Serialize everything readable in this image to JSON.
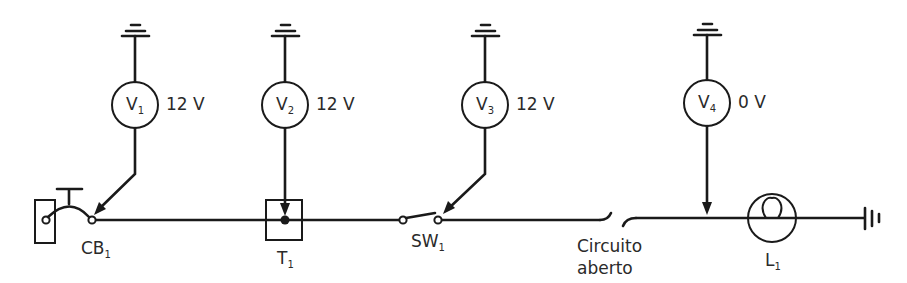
{
  "diagram": {
    "title": "",
    "main_wire_color": "#1a1a1a",
    "meters": [
      {
        "id": "V1",
        "letter": "V",
        "sub": "1",
        "reading": "12 V",
        "probe_target": "CB1"
      },
      {
        "id": "V2",
        "letter": "V",
        "sub": "2",
        "reading": "12 V",
        "probe_target": "T1"
      },
      {
        "id": "V3",
        "letter": "V",
        "sub": "3",
        "reading": "12 V",
        "probe_target": "SW1"
      },
      {
        "id": "V4",
        "letter": "V",
        "sub": "4",
        "reading": "0 V",
        "probe_target": "wire-after-open"
      }
    ],
    "components": [
      {
        "id": "CB1",
        "letter": "CB",
        "sub": "1",
        "type": "circuit-breaker"
      },
      {
        "id": "T1",
        "letter": "T",
        "sub": "1",
        "type": "terminal-junction"
      },
      {
        "id": "SW1",
        "letter": "SW",
        "sub": "1",
        "type": "switch"
      },
      {
        "id": "L1",
        "letter": "L",
        "sub": "1",
        "type": "lamp"
      }
    ],
    "open_circuit": {
      "line1": "Circuito",
      "line2": "aberto"
    },
    "grounds": [
      "V1-ground",
      "V2-ground",
      "V3-ground",
      "V4-ground",
      "chassis-ground"
    ]
  }
}
